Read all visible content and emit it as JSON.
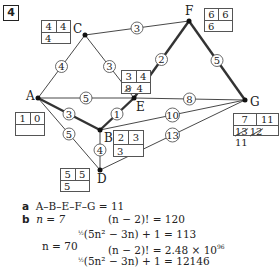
{
  "question_number": "4",
  "nodes": {
    "A": {
      "label": "A",
      "x": 38,
      "y": 98
    },
    "B": {
      "label": "B",
      "x": 100,
      "y": 130
    },
    "C": {
      "label": "C",
      "x": 85,
      "y": 35
    },
    "D": {
      "label": "D",
      "x": 100,
      "y": 170
    },
    "E": {
      "label": "E",
      "x": 134,
      "y": 98
    },
    "F": {
      "label": "F",
      "x": 189,
      "y": 21
    },
    "G": {
      "label": "G",
      "x": 245,
      "y": 100
    }
  },
  "edges": [
    {
      "from": "A",
      "to": "C",
      "weight": "4",
      "bold": false
    },
    {
      "from": "C",
      "to": "F",
      "weight": "3",
      "bold": false
    },
    {
      "from": "C",
      "to": "E",
      "weight": "3",
      "bold": false
    },
    {
      "from": "A",
      "to": "E",
      "weight": "5",
      "bold": false
    },
    {
      "from": "E",
      "to": "G",
      "weight": "8",
      "bold": false
    },
    {
      "from": "E",
      "to": "F",
      "weight": "2",
      "bold": true
    },
    {
      "from": "F",
      "to": "G",
      "weight": "5",
      "bold": true
    },
    {
      "from": "A",
      "to": "B",
      "weight": "3",
      "bold": true
    },
    {
      "from": "B",
      "to": "E",
      "weight": "1",
      "bold": true
    },
    {
      "from": "A",
      "to": "D",
      "weight": "5",
      "bold": false
    },
    {
      "from": "B",
      "to": "D",
      "weight": "4",
      "bold": false
    },
    {
      "from": "B",
      "to": "G",
      "weight": "10",
      "bold": false
    },
    {
      "from": "D",
      "to": "G",
      "weight": "13",
      "bold": false
    }
  ],
  "boxes": {
    "A": {
      "order": "1",
      "final": "0",
      "working": [],
      "value": ""
    },
    "B": {
      "order": "2",
      "final": "3",
      "working": [],
      "value": "3"
    },
    "C": {
      "order": "4",
      "final": "4",
      "working": [],
      "value": "4"
    },
    "D": {
      "order": "5",
      "final": "5",
      "working": [],
      "value": "5"
    },
    "E": {
      "order": "3",
      "final": "4",
      "working": [
        "8"
      ],
      "value": "4"
    },
    "F": {
      "order": "6",
      "final": "6",
      "working": [],
      "value": "6"
    },
    "G": {
      "order": "7",
      "final": "11",
      "working": [
        "13",
        "12"
      ],
      "value": "11"
    }
  },
  "answers": {
    "a_label": "a",
    "a_text": "A–B–E–F–G = 11",
    "b_label": "b",
    "n7": "n = 7",
    "n7_fact": "(n − 2)! = 120",
    "n7_poly": "(5n² − 3n) + 1 = 113",
    "n70": "n = 70",
    "n70_fact": "(n − 2)! = 2.48 × 10",
    "n70_exp": "96",
    "n70_poly": "(5n² − 3n) + 1 = 12146",
    "half": "½"
  }
}
